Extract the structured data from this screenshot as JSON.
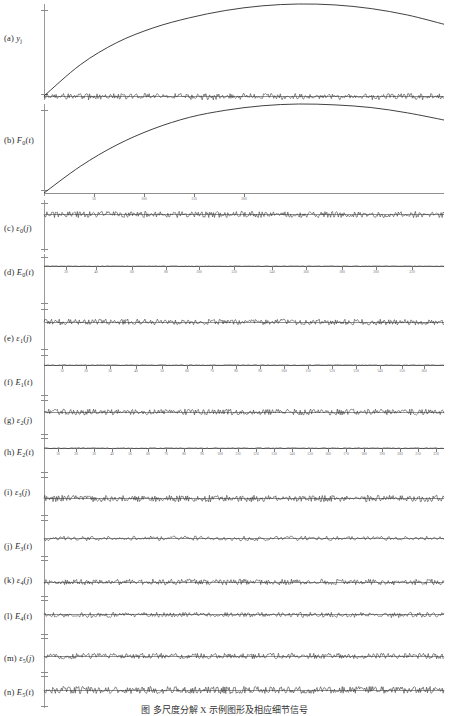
{
  "figure": {
    "caption": "图    多尺度分解 X  示例图形及相应细节信号",
    "background": "#ffffff",
    "line_color": "#2b2b2b",
    "axis_color": "#9a9a9a"
  },
  "chart_data": {
    "type": "line",
    "title": "",
    "xlabel": "",
    "ylabel": "",
    "grid": false,
    "legend": "none",
    "panel_count": 14,
    "x": [
      0,
      50,
      100,
      150,
      200
    ],
    "xlim": [
      0,
      200
    ],
    "panels": [
      {
        "id": "a",
        "label_prefix": "(a)",
        "symbol": "y",
        "sub": "j",
        "kind": "smooth-curve",
        "description": "smooth concave arch rising from origin, peaking near x=145 then declining",
        "values": [
          0,
          34,
          58,
          74,
          85,
          93,
          98,
          100,
          99,
          95,
          88,
          78
        ],
        "ylim": [
          -6,
          104
        ],
        "noise_overlay": true,
        "xticks": [],
        "xticklabels": []
      },
      {
        "id": "b",
        "label_prefix": "(b)",
        "symbol": "F",
        "sub": "0",
        "arg": "t",
        "kind": "smooth-curve",
        "description": "smooth concave arch rising from origin, peaking near x=150 then declining",
        "values": [
          0,
          30,
          54,
          72,
          85,
          93,
          98,
          100,
          99,
          96,
          90,
          82
        ],
        "ylim": [
          -6,
          104
        ],
        "noise_overlay": false,
        "xticks": [
          50,
          100,
          150,
          200
        ],
        "xticklabels": [
          "50",
          "100",
          "150",
          "200"
        ]
      },
      {
        "id": "c",
        "label_prefix": "(c)",
        "symbol": "ε",
        "sub": "0",
        "arg": "j",
        "kind": "dense-noise",
        "description": "dense high-frequency noise band about zero",
        "amplitude": 3.2,
        "density": 420,
        "ylim": [
          -10,
          10
        ],
        "xticks": [],
        "xticklabels": []
      },
      {
        "id": "d",
        "label_prefix": "(d)",
        "symbol": "E",
        "sub": "0",
        "arg": "t",
        "kind": "flat-ticked",
        "description": "near-flat line at zero with sparse downward tick marks and labels",
        "amplitude": 0.5,
        "tick_count": 10,
        "ylim": [
          -10,
          10
        ],
        "xticks": [
          22,
          52,
          88,
          122,
          155,
          190,
          228,
          262,
          298,
          332,
          368
        ],
        "xticklabels": [
          "20",
          "40",
          "60",
          "80",
          "100",
          "120",
          "140",
          "160",
          "180",
          "200",
          "220"
        ]
      },
      {
        "id": "e",
        "label_prefix": "(e)",
        "symbol": "ε",
        "sub": "1",
        "arg": "j",
        "kind": "dense-noise",
        "description": "dense high-frequency noise band about zero",
        "amplitude": 3.0,
        "density": 420,
        "ylim": [
          -10,
          10
        ],
        "xticks": [],
        "xticklabels": []
      },
      {
        "id": "f",
        "label_prefix": "(f)",
        "symbol": "E",
        "sub": "1",
        "arg": "t",
        "kind": "flat-ticked",
        "description": "near-flat line at zero with regularly spaced downward tick marks",
        "amplitude": 0.6,
        "tick_count": 17,
        "ylim": [
          -10,
          10
        ],
        "xticks": [
          18,
          42,
          66,
          92,
          118,
          143,
          168,
          192,
          216,
          240,
          264,
          288,
          312,
          336,
          358,
          380
        ],
        "xticklabels": [
          "10",
          "20",
          "30",
          "40",
          "50",
          "60",
          "70",
          "80",
          "90",
          "100",
          "110",
          "120",
          "130",
          "140",
          "150",
          "160"
        ]
      },
      {
        "id": "g",
        "label_prefix": "(g)",
        "symbol": "ε",
        "sub": "2",
        "arg": "j",
        "kind": "dense-noise",
        "description": "dense high-frequency noise band about zero",
        "amplitude": 3.0,
        "density": 420,
        "ylim": [
          -10,
          10
        ],
        "xticks": [],
        "xticklabels": []
      },
      {
        "id": "h",
        "label_prefix": "(h)",
        "symbol": "E",
        "sub": "2",
        "arg": "t",
        "kind": "flat-ticked",
        "description": "near-flat line at zero with regularly spaced downward tick marks",
        "amplitude": 0.7,
        "tick_count": 22,
        "ylim": [
          -10,
          10
        ],
        "xticks": [
          14,
          32,
          50,
          68,
          86,
          104,
          122,
          140,
          158,
          176,
          194,
          212,
          230,
          248,
          266,
          284,
          302,
          320,
          338,
          356,
          374,
          392
        ],
        "xticklabels": [
          "10",
          "20",
          "30",
          "40",
          "50",
          "60",
          "70",
          "80",
          "90",
          "100",
          "110",
          "120",
          "130",
          "140",
          "150",
          "160",
          "170",
          "180",
          "190",
          "200",
          "210",
          "220"
        ]
      },
      {
        "id": "i",
        "label_prefix": "(i)",
        "symbol": "ε",
        "sub": "3",
        "arg": "j",
        "kind": "dense-noise",
        "description": "dense high-frequency noise band about zero",
        "amplitude": 3.4,
        "density": 440,
        "ylim": [
          -10,
          10
        ],
        "xticks": [],
        "xticklabels": []
      },
      {
        "id": "j",
        "label_prefix": "(j)",
        "symbol": "E",
        "sub": "3",
        "arg": "t",
        "kind": "hairline-noise",
        "description": "thin spiky hairline noise about zero with many small downward ticks",
        "amplitude": 2.0,
        "density": 300,
        "ylim": [
          -10,
          10
        ],
        "xticks": [],
        "xticklabels": []
      },
      {
        "id": "k",
        "label_prefix": "(k)",
        "symbol": "ε",
        "sub": "4",
        "arg": "j",
        "kind": "dense-noise",
        "description": "dense high-frequency noise band about zero",
        "amplitude": 3.0,
        "density": 430,
        "ylim": [
          -10,
          10
        ],
        "xticks": [],
        "xticklabels": []
      },
      {
        "id": "l",
        "label_prefix": "(l)",
        "symbol": "E",
        "sub": "4",
        "arg": "t",
        "kind": "hairline-noise",
        "description": "thin dense spiky noise about zero",
        "amplitude": 2.2,
        "density": 380,
        "ylim": [
          -10,
          10
        ],
        "xticks": [],
        "xticklabels": []
      },
      {
        "id": "m",
        "label_prefix": "(m)",
        "symbol": "ε",
        "sub": "5",
        "arg": "j",
        "kind": "dense-noise",
        "description": "dense high-frequency noise band about zero",
        "amplitude": 2.8,
        "density": 430,
        "ylim": [
          -10,
          10
        ],
        "xticks": [],
        "xticklabels": []
      },
      {
        "id": "n",
        "label_prefix": "(n)",
        "symbol": "E",
        "sub": "5",
        "arg": "t",
        "kind": "dense-noise",
        "description": "thick dark dense noise band about zero",
        "amplitude": 3.6,
        "density": 460,
        "ylim": [
          -10,
          10
        ],
        "xticks": [],
        "xticklabels": []
      }
    ]
  }
}
